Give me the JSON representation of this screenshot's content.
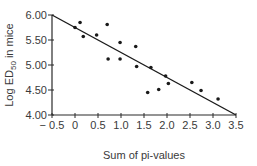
{
  "chart_data": {
    "type": "scatter",
    "title": "",
    "xlabel": "Sum of pi-values",
    "ylabel": "Log ED50 in mice",
    "ylabel_parts": {
      "pre": "Log ED",
      "sub": "50",
      "post": " in mice"
    },
    "xlim": [
      -0.5,
      3.5
    ],
    "ylim": [
      4.0,
      6.0
    ],
    "xticks": [
      -0.5,
      0,
      0.5,
      1.0,
      1.5,
      2.0,
      2.5,
      3.0,
      3.5
    ],
    "xtick_labels": [
      "− 0.5",
      "0",
      "0.5",
      "1.0",
      "1.5",
      "2.0",
      "2.5",
      "3.0",
      "3.5"
    ],
    "yticks": [
      4.0,
      4.5,
      5.0,
      5.5,
      6.0
    ],
    "ytick_labels": [
      "4.00",
      "4.50",
      "5.00",
      "5.50",
      "6.00"
    ],
    "grid": false,
    "legend": null,
    "points": [
      {
        "x": 0.0,
        "y": 5.75
      },
      {
        "x": 0.11,
        "y": 5.85
      },
      {
        "x": 0.18,
        "y": 5.57
      },
      {
        "x": 0.47,
        "y": 5.6
      },
      {
        "x": 0.7,
        "y": 5.81
      },
      {
        "x": 0.72,
        "y": 5.12
      },
      {
        "x": 0.98,
        "y": 5.45
      },
      {
        "x": 0.98,
        "y": 5.12
      },
      {
        "x": 1.32,
        "y": 5.37
      },
      {
        "x": 1.34,
        "y": 4.97
      },
      {
        "x": 1.65,
        "y": 4.95
      },
      {
        "x": 1.58,
        "y": 4.45
      },
      {
        "x": 1.82,
        "y": 4.51
      },
      {
        "x": 1.97,
        "y": 4.78
      },
      {
        "x": 2.03,
        "y": 4.63
      },
      {
        "x": 2.54,
        "y": 4.65
      },
      {
        "x": 2.74,
        "y": 4.49
      },
      {
        "x": 3.11,
        "y": 4.32
      }
    ],
    "regression_line": {
      "x1": -0.5,
      "y1": 6.0,
      "x2": 3.5,
      "y2": 4.0
    },
    "colors": {
      "points": "#1a1a1a",
      "line": "#1a1a1a",
      "axis": "#2a2a2a",
      "text": "#3a3a3a"
    }
  }
}
